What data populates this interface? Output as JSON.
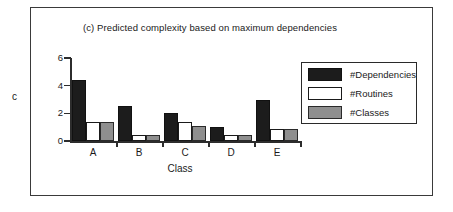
{
  "figure": {
    "axis_label_y": "c",
    "frame": true
  },
  "chart_data": {
    "type": "bar",
    "title": "(c) Predicted complexity based on maximum dependencies",
    "xlabel": "Class",
    "ylabel": "c",
    "categories": [
      "A",
      "B",
      "C",
      "D",
      "E"
    ],
    "series": [
      {
        "name": "#Dependencies",
        "color": "#1c1c1c",
        "values": [
          4.4,
          2.55,
          2.0,
          1.0,
          3.0
        ]
      },
      {
        "name": "#Routines",
        "color": "#ffffff",
        "values": [
          1.35,
          0.45,
          1.4,
          0.45,
          0.85
        ]
      },
      {
        "name": "#Classes",
        "color": "#8f8f8f",
        "values": [
          1.35,
          0.45,
          1.05,
          0.4,
          0.85
        ]
      }
    ],
    "ylim": [
      0,
      6
    ],
    "yticks": [
      0,
      2,
      4,
      6
    ],
    "ytick_labels": [
      "0",
      "2",
      "4",
      "6"
    ],
    "grid": false,
    "legend_position": "right"
  },
  "legend": {
    "entries": [
      {
        "label": "#Dependencies",
        "swatch": "black-swatch"
      },
      {
        "label": "#Routines",
        "swatch": "white-swatch"
      },
      {
        "label": "#Classes",
        "swatch": "gray-swatch"
      }
    ]
  }
}
